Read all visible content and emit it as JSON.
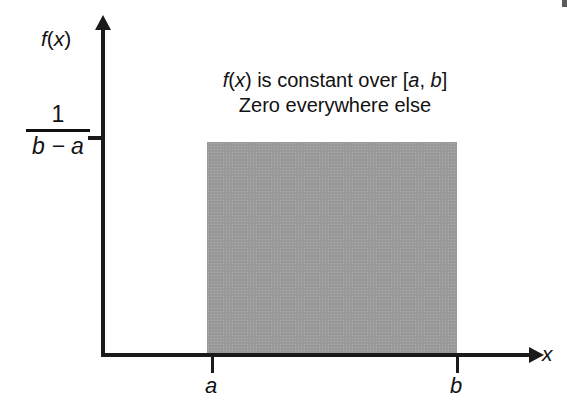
{
  "figure": {
    "axes": {
      "y_label": "f(x)",
      "x_label": "x",
      "y_tick_numerator": "1",
      "y_tick_denominator": "b − a",
      "x_tick_labels": [
        "a",
        "b"
      ]
    },
    "annotation": {
      "line1": "f(x) is constant over [a, b]",
      "line2": "Zero everywhere else"
    },
    "colors": {
      "region_fill": "#999999",
      "axis": "#1a1a1a",
      "text": "#111111",
      "background": "#ffffff"
    }
  },
  "chart_data": {
    "type": "area",
    "title": "",
    "subtitle": "",
    "xlabel": "x",
    "ylabel": "f(x)",
    "series": [
      {
        "name": "Uniform density",
        "x": [
          "a",
          "b"
        ],
        "values": [
          "1/(b-a)",
          "1/(b-a)"
        ]
      }
    ],
    "x_ticks": [
      "a",
      "b"
    ],
    "y_ticks": [
      "1/(b-a)"
    ],
    "xlim": [
      "a",
      "b"
    ],
    "ylim": [
      0,
      "1/(b-a)"
    ],
    "grid": false,
    "legend": "none",
    "annotations": [
      "f(x) is constant over [a, b]",
      "Zero everywhere else"
    ]
  }
}
